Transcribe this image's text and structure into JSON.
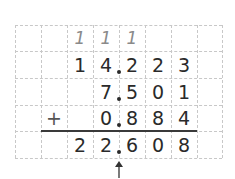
{
  "operation": "decimal addition",
  "carries": [
    "1",
    "1",
    "1"
  ],
  "addend1": "14.223",
  "addend2": "7.501",
  "addend3": "0.884",
  "operator": "+",
  "sum": "22.608",
  "rows": {
    "carry": {
      "c2": "1",
      "c3": "1",
      "c4": "1"
    },
    "row1": {
      "c2": "1",
      "c3": "4",
      "c4": "2",
      "c5": "2",
      "c6": "3"
    },
    "row2": {
      "c3": "7",
      "c4": "5",
      "c5": "0",
      "c6": "1"
    },
    "row3": {
      "c1": "+",
      "c3": "0",
      "c4": "8",
      "c5": "8",
      "c6": "4"
    },
    "result": {
      "c2": "2",
      "c3": "2",
      "c4": "6",
      "c5": "0",
      "c6": "8"
    }
  },
  "decimal_point_indicator": "arrow-up"
}
